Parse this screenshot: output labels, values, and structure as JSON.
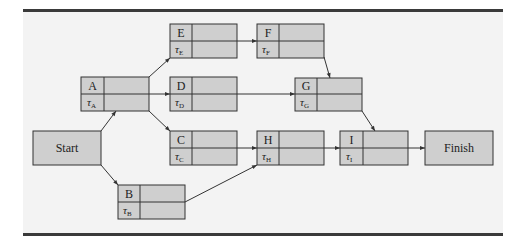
{
  "diagram": {
    "type": "activity-on-node network",
    "colors": {
      "background": "#ffffff",
      "panel": "#f3f3f3",
      "rule": "#3a3a3a",
      "node_fill": "#cfcfcf",
      "node_stroke": "#333333"
    },
    "terminals": [
      {
        "id": "start",
        "label": "Start"
      },
      {
        "id": "finish",
        "label": "Finish"
      }
    ],
    "activities": [
      {
        "id": "A",
        "label": "A",
        "tau": "τ",
        "sub": "A"
      },
      {
        "id": "B",
        "label": "B",
        "tau": "τ",
        "sub": "B"
      },
      {
        "id": "C",
        "label": "C",
        "tau": "τ",
        "sub": "C"
      },
      {
        "id": "D",
        "label": "D",
        "tau": "τ",
        "sub": "D"
      },
      {
        "id": "E",
        "label": "E",
        "tau": "τ",
        "sub": "E"
      },
      {
        "id": "F",
        "label": "F",
        "tau": "τ",
        "sub": "F"
      },
      {
        "id": "G",
        "label": "G",
        "tau": "τ",
        "sub": "G"
      },
      {
        "id": "H",
        "label": "H",
        "tau": "τ",
        "sub": "H"
      },
      {
        "id": "I",
        "label": "I",
        "tau": "τ",
        "sub": "I"
      }
    ],
    "edges": [
      [
        "Start",
        "A"
      ],
      [
        "Start",
        "B"
      ],
      [
        "A",
        "E"
      ],
      [
        "A",
        "D"
      ],
      [
        "A",
        "C"
      ],
      [
        "E",
        "F"
      ],
      [
        "F",
        "G"
      ],
      [
        "D",
        "G"
      ],
      [
        "C",
        "H"
      ],
      [
        "B",
        "H"
      ],
      [
        "G",
        "I"
      ],
      [
        "H",
        "I"
      ],
      [
        "I",
        "Finish"
      ]
    ]
  }
}
